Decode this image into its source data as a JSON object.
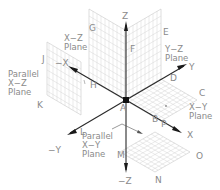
{
  "diagram": {
    "axes": {
      "z_pos": "Z",
      "z_neg": "−Z",
      "x_pos": "X",
      "x_neg": "−X",
      "y_pos": "Y",
      "y_neg": "−Y"
    },
    "origin_label": "A",
    "point_labels": {
      "B": "B",
      "C": "C",
      "D": "D",
      "E": "E",
      "F": "F",
      "G": "G",
      "H": "H",
      "J": "J",
      "K": "K",
      "L": "L",
      "M": "M",
      "N": "N",
      "O": "O",
      "P": "P"
    },
    "planes": {
      "xz": {
        "line1": "X−Z",
        "line2": "Plane"
      },
      "yz": {
        "line1": "Y−Z",
        "line2": "Plane"
      },
      "xy": {
        "line1": "X−Y",
        "line2": "Plane"
      },
      "parallel_xz": {
        "line1": "Parallel",
        "line2": "X−Z",
        "line3": "Plane"
      },
      "parallel_xy": {
        "line1": "Parallel",
        "line2": "X−Y",
        "line3": "Plane"
      }
    },
    "colors": {
      "axis": "#2a2a2a",
      "grid": "#d4d4d4",
      "label": "#8a8a8a",
      "background": "#ffffff"
    }
  }
}
